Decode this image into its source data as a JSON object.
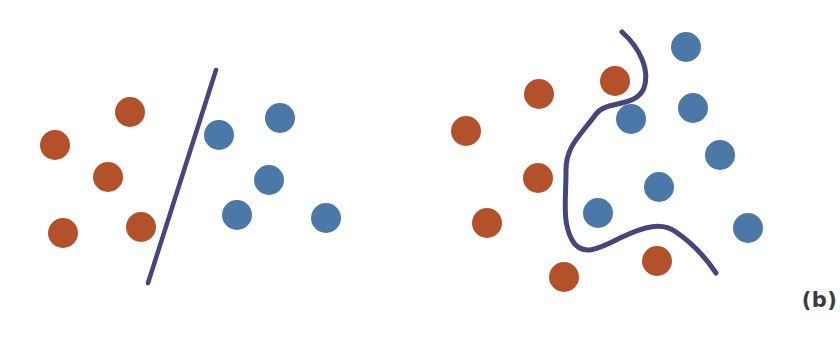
{
  "figure": {
    "background_color": "#ffffff",
    "width": 799,
    "height": 356
  },
  "colors": {
    "class_red": "#b3512b",
    "class_blue": "#4c78a8",
    "boundary": "#46467a",
    "caption_text": "#3b3b3b"
  },
  "panels": [
    {
      "id": "a",
      "caption": "(a)",
      "boundary_type": "straight-line",
      "boundary_stroke_width": 4.5
    },
    {
      "id": "b",
      "caption": "(b)",
      "boundary_type": "curved-line",
      "boundary_stroke_width": 5
    }
  ],
  "chart_data": {
    "type": "scatter",
    "title": "",
    "subtitle": "",
    "xlabel": "",
    "ylabel": "",
    "grid": false,
    "legend": null,
    "axis_visible": false,
    "tick_labels": [],
    "annotations": [
      "(a)",
      "(b)"
    ],
    "panels": [
      {
        "name": "(a)",
        "description": "Linearly separable classes divided by a single straight decision boundary",
        "boundary": {
          "kind": "line",
          "points": [
            [
              216,
              70
            ],
            [
              148,
              283
            ]
          ],
          "color": "#46467a",
          "width": 4.5
        },
        "series": [
          {
            "name": "red",
            "color": "#b3512b",
            "radius": 15,
            "points": [
              [
                130,
                112
              ],
              [
                55,
                145
              ],
              [
                108,
                177
              ],
              [
                141,
                227
              ],
              [
                63,
                233
              ]
            ]
          },
          {
            "name": "blue",
            "color": "#4c78a8",
            "radius": 15,
            "points": [
              [
                219,
                135
              ],
              [
                280,
                118
              ],
              [
                269,
                180
              ],
              [
                237,
                215
              ],
              [
                326,
                218
              ]
            ]
          }
        ]
      },
      {
        "name": "(b)",
        "description": "Non-linearly separable classes divided by a curved decision boundary",
        "boundary": {
          "kind": "curve",
          "path": "M 622 32 C 640 48 650 70 644 88 C 636 108 606 100 596 114 C 580 136 566 146 566 170 C 566 200 562 222 572 240 C 582 258 600 248 620 238 C 645 226 662 222 676 232 C 692 243 706 258 716 273",
          "color": "#46467a",
          "width": 5
        },
        "series": [
          {
            "name": "red",
            "color": "#b3512b",
            "radius": 15,
            "points": [
              [
                615,
                81
              ],
              [
                539,
                94
              ],
              [
                466,
                131
              ],
              [
                538,
                178
              ],
              [
                487,
                223
              ],
              [
                657,
                261
              ],
              [
                564,
                277
              ]
            ]
          },
          {
            "name": "blue",
            "color": "#4c78a8",
            "radius": 15,
            "points": [
              [
                686,
                47
              ],
              [
                631,
                119
              ],
              [
                693,
                108
              ],
              [
                720,
                155
              ],
              [
                659,
                187
              ],
              [
                598,
                213
              ],
              [
                748,
                228
              ]
            ]
          }
        ]
      }
    ]
  }
}
